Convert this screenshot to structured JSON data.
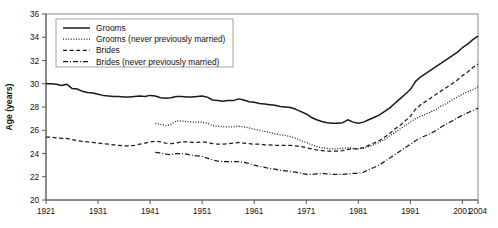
{
  "chart_data": {
    "type": "line",
    "title": "",
    "xlabel": "",
    "ylabel": "Age (years)",
    "xlim": [
      1921,
      2004
    ],
    "ylim": [
      20,
      36
    ],
    "grid": false,
    "legend_position": "top-left",
    "xticks": [
      "1921",
      "1931",
      "1941",
      "1951",
      "1961",
      "1971",
      "1981",
      "1991",
      "2001",
      "2004"
    ],
    "xtick_values": [
      1921,
      1931,
      1941,
      1951,
      1961,
      1971,
      1981,
      1991,
      2001,
      2004
    ],
    "yticks": [
      "20",
      "22",
      "24",
      "26",
      "28",
      "30",
      "32",
      "34",
      "36"
    ],
    "ytick_values": [
      20,
      22,
      24,
      26,
      28,
      30,
      32,
      34,
      36
    ],
    "series": [
      {
        "name": "Grooms",
        "style": "solid",
        "color": "#1a1a1a",
        "x": [
          1921,
          1922,
          1923,
          1924,
          1925,
          1926,
          1927,
          1928,
          1929,
          1930,
          1931,
          1932,
          1933,
          1934,
          1935,
          1936,
          1937,
          1938,
          1939,
          1940,
          1941,
          1942,
          1943,
          1944,
          1945,
          1946,
          1947,
          1948,
          1949,
          1950,
          1951,
          1952,
          1953,
          1954,
          1955,
          1956,
          1957,
          1958,
          1959,
          1960,
          1961,
          1962,
          1963,
          1964,
          1965,
          1966,
          1967,
          1968,
          1969,
          1970,
          1971,
          1972,
          1973,
          1974,
          1975,
          1976,
          1977,
          1978,
          1979,
          1980,
          1981,
          1982,
          1983,
          1984,
          1985,
          1986,
          1987,
          1988,
          1989,
          1990,
          1991,
          1992,
          1993,
          1994,
          1995,
          1996,
          1997,
          1998,
          1999,
          2000,
          2001,
          2002,
          2003,
          2004
        ],
        "values": [
          30.0,
          30.0,
          29.95,
          29.85,
          29.95,
          29.6,
          29.55,
          29.35,
          29.25,
          29.2,
          29.1,
          29.0,
          28.95,
          28.9,
          28.9,
          28.85,
          28.85,
          28.9,
          28.95,
          28.9,
          29.0,
          28.95,
          28.8,
          28.75,
          28.8,
          28.9,
          28.9,
          28.85,
          28.85,
          28.9,
          28.95,
          28.85,
          28.6,
          28.55,
          28.5,
          28.55,
          28.55,
          28.7,
          28.6,
          28.45,
          28.4,
          28.3,
          28.25,
          28.2,
          28.15,
          28.05,
          28.0,
          27.95,
          27.8,
          27.6,
          27.4,
          27.1,
          26.9,
          26.75,
          26.65,
          26.6,
          26.6,
          26.65,
          26.9,
          26.7,
          26.6,
          26.7,
          26.9,
          27.1,
          27.3,
          27.6,
          27.9,
          28.3,
          28.7,
          29.1,
          29.5,
          30.2,
          30.6,
          30.9,
          31.2,
          31.5,
          31.8,
          32.1,
          32.4,
          32.7,
          33.1,
          33.4,
          33.8,
          34.1
        ]
      },
      {
        "name": "Grooms (never previously married)",
        "style": "dotted",
        "color": "#1a1a1a",
        "x": [
          1942,
          1943,
          1944,
          1945,
          1946,
          1947,
          1948,
          1949,
          1950,
          1951,
          1952,
          1953,
          1954,
          1955,
          1956,
          1957,
          1958,
          1959,
          1960,
          1961,
          1962,
          1963,
          1964,
          1965,
          1966,
          1967,
          1968,
          1969,
          1970,
          1971,
          1972,
          1973,
          1974,
          1975,
          1976,
          1977,
          1978,
          1979,
          1980,
          1981,
          1982,
          1983,
          1984,
          1985,
          1986,
          1987,
          1988,
          1989,
          1990,
          1991,
          1992,
          1993,
          1994,
          1995,
          1996,
          1997,
          1998,
          1999,
          2000,
          2001,
          2002,
          2003,
          2004
        ],
        "values": [
          26.6,
          26.5,
          26.4,
          26.5,
          26.8,
          26.8,
          26.75,
          26.7,
          26.7,
          26.7,
          26.6,
          26.4,
          26.35,
          26.3,
          26.3,
          26.3,
          26.35,
          26.3,
          26.2,
          26.1,
          26.0,
          25.9,
          25.8,
          25.7,
          25.6,
          25.55,
          25.45,
          25.3,
          25.1,
          24.95,
          24.75,
          24.6,
          24.5,
          24.45,
          24.4,
          24.4,
          24.45,
          24.5,
          24.45,
          24.4,
          24.45,
          24.6,
          24.75,
          24.95,
          25.2,
          25.5,
          25.8,
          26.1,
          26.4,
          26.7,
          27.0,
          27.2,
          27.4,
          27.6,
          27.8,
          28.1,
          28.3,
          28.6,
          28.85,
          29.1,
          29.3,
          29.5,
          29.75
        ]
      },
      {
        "name": "Brides",
        "style": "dashed",
        "color": "#1a1a1a",
        "x": [
          1921,
          1922,
          1923,
          1924,
          1925,
          1926,
          1927,
          1928,
          1929,
          1930,
          1931,
          1932,
          1933,
          1934,
          1935,
          1936,
          1937,
          1938,
          1939,
          1940,
          1941,
          1942,
          1943,
          1944,
          1945,
          1946,
          1947,
          1948,
          1949,
          1950,
          1951,
          1952,
          1953,
          1954,
          1955,
          1956,
          1957,
          1958,
          1959,
          1960,
          1961,
          1962,
          1963,
          1964,
          1965,
          1966,
          1967,
          1968,
          1969,
          1970,
          1971,
          1972,
          1973,
          1974,
          1975,
          1976,
          1977,
          1978,
          1979,
          1980,
          1981,
          1982,
          1983,
          1984,
          1985,
          1986,
          1987,
          1988,
          1989,
          1990,
          1991,
          1992,
          1993,
          1994,
          1995,
          1996,
          1997,
          1998,
          1999,
          2000,
          2001,
          2002,
          2003,
          2004
        ],
        "values": [
          25.4,
          25.4,
          25.35,
          25.3,
          25.3,
          25.2,
          25.1,
          25.05,
          25.0,
          24.95,
          24.9,
          24.85,
          24.8,
          24.75,
          24.7,
          24.65,
          24.65,
          24.7,
          24.8,
          24.9,
          25.0,
          25.05,
          25.0,
          24.9,
          24.85,
          24.9,
          25.0,
          25.0,
          24.95,
          24.95,
          25.0,
          24.95,
          24.85,
          24.8,
          24.8,
          24.85,
          24.9,
          24.95,
          24.9,
          24.85,
          24.8,
          24.8,
          24.75,
          24.75,
          24.7,
          24.7,
          24.7,
          24.7,
          24.65,
          24.6,
          24.5,
          24.4,
          24.3,
          24.25,
          24.2,
          24.2,
          24.2,
          24.25,
          24.35,
          24.4,
          24.4,
          24.5,
          24.7,
          24.9,
          25.1,
          25.4,
          25.7,
          26.1,
          26.4,
          26.8,
          27.2,
          27.8,
          28.2,
          28.5,
          28.8,
          29.1,
          29.4,
          29.7,
          30.0,
          30.3,
          30.7,
          31.0,
          31.4,
          31.7
        ]
      },
      {
        "name": "Brides (never previously married)",
        "style": "dashdot",
        "color": "#1a1a1a",
        "x": [
          1942,
          1943,
          1944,
          1945,
          1946,
          1947,
          1948,
          1949,
          1950,
          1951,
          1952,
          1953,
          1954,
          1955,
          1956,
          1957,
          1958,
          1959,
          1960,
          1961,
          1962,
          1963,
          1964,
          1965,
          1966,
          1967,
          1968,
          1969,
          1970,
          1971,
          1972,
          1973,
          1974,
          1975,
          1976,
          1977,
          1978,
          1979,
          1980,
          1981,
          1982,
          1983,
          1984,
          1985,
          1986,
          1987,
          1988,
          1989,
          1990,
          1991,
          1992,
          1993,
          1994,
          1995,
          1996,
          1997,
          1998,
          1999,
          2000,
          2001,
          2002,
          2003,
          2004
        ],
        "values": [
          24.1,
          24.05,
          23.95,
          23.9,
          24.0,
          24.0,
          23.95,
          23.85,
          23.8,
          23.75,
          23.6,
          23.45,
          23.35,
          23.3,
          23.3,
          23.3,
          23.3,
          23.25,
          23.15,
          23.0,
          22.9,
          22.8,
          22.7,
          22.65,
          22.55,
          22.5,
          22.45,
          22.4,
          22.3,
          22.2,
          22.2,
          22.25,
          22.3,
          22.25,
          22.2,
          22.2,
          22.2,
          22.25,
          22.3,
          22.3,
          22.4,
          22.6,
          22.8,
          23.0,
          23.3,
          23.6,
          23.9,
          24.2,
          24.5,
          24.8,
          25.1,
          25.35,
          25.55,
          25.75,
          26.0,
          26.3,
          26.55,
          26.8,
          27.05,
          27.3,
          27.5,
          27.7,
          27.9
        ]
      }
    ]
  },
  "legend": {
    "items": [
      {
        "label": "Grooms",
        "style": "solid"
      },
      {
        "label": "Grooms (never previously married)",
        "style": "dotted"
      },
      {
        "label": "Brides",
        "style": "dashed"
      },
      {
        "label": "Brides (never previously married)",
        "style": "dashdot"
      }
    ]
  },
  "axes": {
    "y_title": "Age (years)"
  }
}
